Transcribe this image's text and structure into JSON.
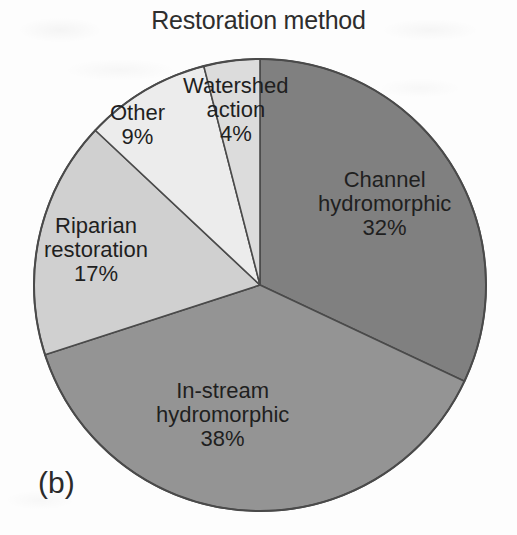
{
  "figure": {
    "title": "Restoration method",
    "panel_label": "(b)"
  },
  "chart_data": {
    "type": "pie",
    "title": "Restoration method",
    "xlabel": "",
    "ylabel": "",
    "legend_position": "none",
    "labels_inside_slices": true,
    "start_angle_deg": 0,
    "direction": "clockwise",
    "categories": [
      "Channel hydromorphic",
      "In-stream hydromorphic",
      "Riparian restoration",
      "Other",
      "Watershed action"
    ],
    "values": [
      32,
      38,
      17,
      9,
      4
    ],
    "value_unit": "%",
    "colors": [
      "#808080",
      "#949494",
      "#d0d0d0",
      "#ececec",
      "#dcdcdc"
    ],
    "slices": [
      {
        "label": "Channel hydromorphic",
        "value": 32,
        "display": "32%",
        "color": "#808080"
      },
      {
        "label": "In-stream hydromorphic",
        "value": 38,
        "display": "38%",
        "color": "#949494"
      },
      {
        "label": "Riparian restoration",
        "value": 17,
        "display": "17%",
        "color": "#d0d0d0"
      },
      {
        "label": "Other",
        "value": 9,
        "display": "9%",
        "color": "#ececec"
      },
      {
        "label": "Watershed action",
        "value": 4,
        "display": "4%",
        "color": "#dcdcdc"
      }
    ]
  },
  "labels": {
    "channel": {
      "line1": "Channel",
      "line2": "hydromorphic",
      "pct": "32%"
    },
    "instream": {
      "line1": "In-stream",
      "line2": "hydromorphic",
      "pct": "38%"
    },
    "riparian": {
      "line1": "Riparian",
      "line2": "restoration",
      "pct": "17%"
    },
    "other": {
      "line1": "Other",
      "pct": "9%"
    },
    "watershed": {
      "line1": "Watershed",
      "line2": "action",
      "pct": "4%"
    }
  },
  "style": {
    "outline_color": "#4a4a4a",
    "text_color": "#1f1f1f",
    "background": "#fdfdfd"
  }
}
